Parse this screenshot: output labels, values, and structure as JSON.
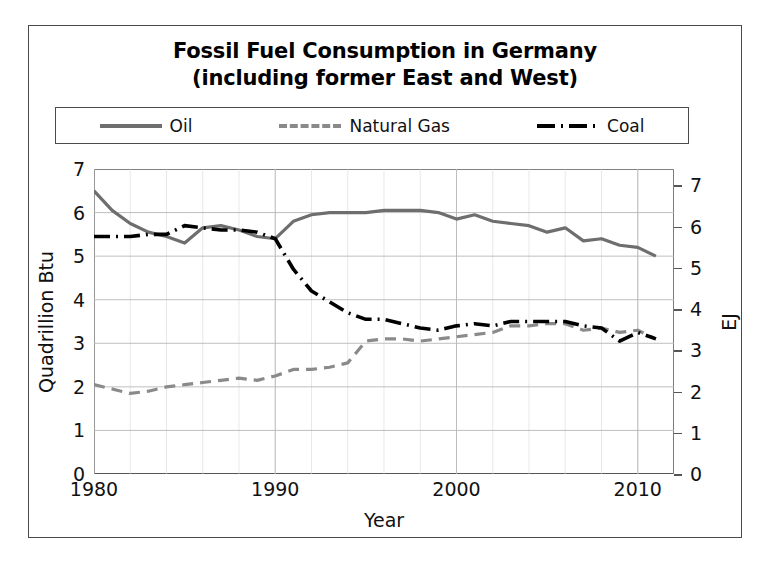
{
  "figure": {
    "title_line1": "Fossil Fuel Consumption in Germany",
    "title_line2": "(including former East and West)",
    "border_color": "#4a4a4a",
    "background": "#ffffff"
  },
  "legend": {
    "position": "top-inside",
    "entries": [
      {
        "label": "Oil",
        "style": "solid",
        "color": "#6e6e6e"
      },
      {
        "label": "Natural Gas",
        "style": "dashed",
        "color": "#8a8a8a"
      },
      {
        "label": "Coal",
        "style": "dashdot",
        "color": "#000000"
      }
    ]
  },
  "axes": {
    "left_title": "Quadrillion Btu",
    "right_title": "EJ",
    "x_title": "Year",
    "y_ticks": [
      "0",
      "1",
      "2",
      "3",
      "4",
      "5",
      "6",
      "7"
    ],
    "y_right_ticks": [
      "0",
      "1",
      "2",
      "3",
      "4",
      "5",
      "6",
      "7"
    ],
    "x_ticks": [
      "1980",
      "1990",
      "2000",
      "2010"
    ],
    "grid": "major and minor, light gray"
  },
  "chart_data": {
    "type": "line",
    "title": "Fossil Fuel Consumption in Germany (including former East and West)",
    "xlabel": "Year",
    "ylabel": "Quadrillion Btu",
    "ylabel_secondary": "EJ",
    "xlim": [
      1980,
      2012
    ],
    "ylim": [
      0,
      7
    ],
    "ylim_secondary": [
      0,
      7.4
    ],
    "grid": true,
    "legend_position": "top",
    "x": [
      1980,
      1981,
      1982,
      1983,
      1984,
      1985,
      1986,
      1987,
      1988,
      1989,
      1990,
      1991,
      1992,
      1993,
      1994,
      1995,
      1996,
      1997,
      1998,
      1999,
      2000,
      2001,
      2002,
      2003,
      2004,
      2005,
      2006,
      2007,
      2008,
      2009,
      2010,
      2011
    ],
    "series": [
      {
        "name": "Oil",
        "color": "#6e6e6e",
        "style": "solid",
        "values": [
          6.5,
          6.05,
          5.75,
          5.55,
          5.45,
          5.3,
          5.65,
          5.7,
          5.6,
          5.45,
          5.4,
          5.8,
          5.95,
          6.0,
          6.0,
          6.0,
          6.05,
          6.05,
          6.05,
          6.0,
          5.85,
          5.95,
          5.8,
          5.75,
          5.7,
          5.55,
          5.65,
          5.35,
          5.4,
          5.25,
          5.2,
          5.0
        ]
      },
      {
        "name": "Natural Gas",
        "color": "#8a8a8a",
        "style": "dashed",
        "values": [
          2.05,
          1.95,
          1.85,
          1.9,
          2.0,
          2.05,
          2.1,
          2.15,
          2.2,
          2.15,
          2.25,
          2.4,
          2.4,
          2.45,
          2.55,
          3.05,
          3.1,
          3.1,
          3.05,
          3.1,
          3.15,
          3.2,
          3.25,
          3.4,
          3.4,
          3.45,
          3.45,
          3.3,
          3.35,
          3.25,
          3.3,
          3.1
        ]
      },
      {
        "name": "Coal",
        "color": "#000000",
        "style": "dashdot",
        "values": [
          5.45,
          5.45,
          5.45,
          5.5,
          5.5,
          5.7,
          5.65,
          5.6,
          5.6,
          5.55,
          5.4,
          4.7,
          4.2,
          3.95,
          3.7,
          3.55,
          3.55,
          3.45,
          3.35,
          3.3,
          3.4,
          3.45,
          3.4,
          3.5,
          3.5,
          3.5,
          3.5,
          3.4,
          3.35,
          3.05,
          3.25,
          3.1
        ]
      }
    ]
  }
}
